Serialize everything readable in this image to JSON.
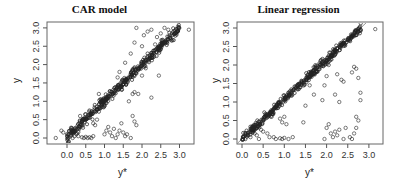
{
  "chart_data": [
    {
      "type": "scatter",
      "title": "CAR model",
      "xlabel": "y*",
      "ylabel": "y",
      "xlim": [
        -0.35,
        3.3
      ],
      "ylim": [
        -0.12,
        3.05
      ],
      "xticks": [
        "0.0",
        "0.5",
        "1.0",
        "1.5",
        "2.0",
        "2.5",
        "3.0"
      ],
      "yticks": [
        "0.0",
        "0.5",
        "1.0",
        "1.5",
        "2.0",
        "2.5",
        "3.0"
      ],
      "grid": false,
      "legend": null,
      "reference_line": null,
      "frame": {
        "x0": 47,
        "x1": 194,
        "y0": 22,
        "y1": 144
      },
      "axis_map": {
        "x_at_0": 67,
        "x_per_unit": 37.5,
        "y_at_0": 138,
        "y_per_unit": 36.7
      },
      "band": {
        "description": "dense points along y = y*",
        "from": 0.0,
        "to": 3.0,
        "n": 420,
        "spread": 0.07,
        "seed": 11
      },
      "outliers": [
        [
          -0.3,
          0.0
        ],
        [
          -0.15,
          0.2
        ],
        [
          -0.1,
          0.15
        ],
        [
          0.05,
          0.1
        ],
        [
          0.1,
          0.05
        ],
        [
          0.15,
          0.0
        ],
        [
          0.2,
          0.05
        ],
        [
          0.25,
          0.1
        ],
        [
          0.3,
          0.05
        ],
        [
          0.4,
          0.02
        ],
        [
          0.45,
          0.0
        ],
        [
          0.5,
          0.03
        ],
        [
          0.55,
          0.0
        ],
        [
          0.6,
          0.02
        ],
        [
          0.65,
          0.0
        ],
        [
          0.7,
          0.05
        ],
        [
          0.35,
          0.6
        ],
        [
          0.5,
          0.65
        ],
        [
          0.6,
          0.75
        ],
        [
          0.7,
          0.4
        ],
        [
          0.75,
          0.35
        ],
        [
          0.8,
          0.5
        ],
        [
          0.85,
          1.2
        ],
        [
          1.0,
          0.1
        ],
        [
          1.05,
          0.2
        ],
        [
          1.1,
          0.3
        ],
        [
          1.15,
          0.15
        ],
        [
          1.2,
          0.05
        ],
        [
          1.25,
          0.25
        ],
        [
          1.3,
          0.0
        ],
        [
          1.35,
          0.1
        ],
        [
          1.4,
          0.2
        ],
        [
          1.45,
          0.4
        ],
        [
          1.5,
          0.15
        ],
        [
          1.55,
          0.05
        ],
        [
          1.6,
          0.1
        ],
        [
          1.7,
          0.0
        ],
        [
          1.75,
          0.6
        ],
        [
          1.8,
          0.45
        ],
        [
          1.85,
          0.35
        ],
        [
          1.65,
          1.0
        ],
        [
          1.75,
          1.2
        ],
        [
          1.8,
          1.25
        ],
        [
          1.9,
          1.2
        ],
        [
          2.25,
          1.1
        ],
        [
          2.45,
          1.7
        ],
        [
          1.35,
          1.65
        ],
        [
          1.4,
          1.8
        ],
        [
          1.55,
          2.05
        ],
        [
          1.7,
          2.3
        ],
        [
          1.8,
          2.6
        ],
        [
          1.85,
          3.0
        ],
        [
          2.0,
          2.5
        ],
        [
          2.05,
          2.8
        ],
        [
          2.15,
          2.9
        ],
        [
          2.25,
          2.95
        ],
        [
          2.35,
          2.55
        ],
        [
          2.4,
          2.75
        ],
        [
          2.5,
          2.85
        ],
        [
          2.0,
          1.7
        ],
        [
          2.1,
          1.9
        ],
        [
          3.25,
          2.95
        ],
        [
          2.7,
          2.95
        ],
        [
          2.6,
          3.0
        ]
      ]
    },
    {
      "type": "scatter",
      "title": "Linear regression",
      "xlabel": "y*",
      "ylabel": "y",
      "xlim": [
        -0.12,
        3.25
      ],
      "ylim": [
        -0.12,
        3.05
      ],
      "xticks": [
        "0.0",
        "0.5",
        "1.0",
        "1.5",
        "2.0",
        "2.5",
        "3.0"
      ],
      "yticks": [
        "0.0",
        "0.5",
        "1.0",
        "1.5",
        "2.0",
        "2.5",
        "3.0"
      ],
      "grid": false,
      "legend": null,
      "reference_line": {
        "slope": 1.07,
        "intercept": 0.0,
        "color": "#666666"
      },
      "frame": {
        "x0": 237,
        "x1": 383,
        "y0": 22,
        "y1": 144
      },
      "axis_map": {
        "x_at_0": 242,
        "x_per_unit": 42.3,
        "y_at_0": 139,
        "y_per_unit": 37.0
      },
      "band": {
        "description": "dense points along y = 1.07·y*",
        "from": 0.0,
        "to": 2.82,
        "n": 420,
        "spread": 0.06,
        "slope": 1.07,
        "seed": 23
      },
      "outliers": [
        [
          0.15,
          0.1
        ],
        [
          0.2,
          0.05
        ],
        [
          0.3,
          0.15
        ],
        [
          0.35,
          0.1
        ],
        [
          0.4,
          0.0
        ],
        [
          0.45,
          0.25
        ],
        [
          0.5,
          0.2
        ],
        [
          0.6,
          0.15
        ],
        [
          0.65,
          0.05
        ],
        [
          0.75,
          0.05
        ],
        [
          0.8,
          0.0
        ],
        [
          0.9,
          0.02
        ],
        [
          0.95,
          0.0
        ],
        [
          1.0,
          0.03
        ],
        [
          1.1,
          0.0
        ],
        [
          1.2,
          0.05
        ],
        [
          0.9,
          0.55
        ],
        [
          0.95,
          0.45
        ],
        [
          1.0,
          0.6
        ],
        [
          1.05,
          0.4
        ],
        [
          0.7,
          0.6
        ],
        [
          1.45,
          0.45
        ],
        [
          1.5,
          0.9
        ],
        [
          1.7,
          1.2
        ],
        [
          1.6,
          1.45
        ],
        [
          1.9,
          1.05
        ],
        [
          1.95,
          1.45
        ],
        [
          1.95,
          0.0
        ],
        [
          2.0,
          0.3
        ],
        [
          2.05,
          0.4
        ],
        [
          2.1,
          0.15
        ],
        [
          2.15,
          0.05
        ],
        [
          2.2,
          0.2
        ],
        [
          2.25,
          0.1
        ],
        [
          2.3,
          0.25
        ],
        [
          2.4,
          0.0
        ],
        [
          2.45,
          0.3
        ],
        [
          2.55,
          0.05
        ],
        [
          2.6,
          0.0
        ],
        [
          2.65,
          0.15
        ],
        [
          2.7,
          0.3
        ],
        [
          2.75,
          0.5
        ],
        [
          2.7,
          0.6
        ],
        [
          2.8,
          1.05
        ],
        [
          2.8,
          1.25
        ],
        [
          2.3,
          1.0
        ],
        [
          2.35,
          1.6
        ],
        [
          2.4,
          1.55
        ],
        [
          2.6,
          1.8
        ],
        [
          2.65,
          1.95
        ],
        [
          2.7,
          1.9
        ],
        [
          2.75,
          1.65
        ],
        [
          2.2,
          1.2
        ],
        [
          2.25,
          1.75
        ],
        [
          2.0,
          1.7
        ],
        [
          2.05,
          2.0
        ],
        [
          2.15,
          2.25
        ],
        [
          2.3,
          2.4
        ],
        [
          2.45,
          2.6
        ],
        [
          3.15,
          2.97
        ],
        [
          2.6,
          2.75
        ],
        [
          2.75,
          2.9
        ]
      ]
    }
  ],
  "panels": [
    {
      "title": "CAR model",
      "xlabel": "y*",
      "ylabel": "y"
    },
    {
      "title": "Linear regression",
      "xlabel": "y*",
      "ylabel": "y"
    }
  ],
  "colors": {
    "axis": "#555555",
    "frame": "#666666",
    "point": "#222222",
    "refline": "#777777",
    "tick_text": "#333333"
  }
}
